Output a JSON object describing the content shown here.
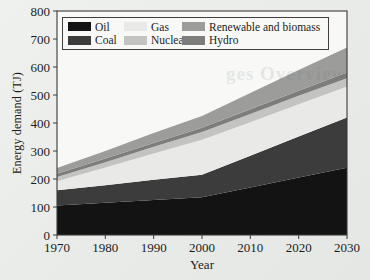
{
  "figure": {
    "background_color": "#e9ebe8",
    "plot_background": "#f8f9f6",
    "frame_color": "#3a3a3a",
    "text_color": "#1c1c1c",
    "ghost_text": "ges Overview"
  },
  "chart_data": {
    "type": "area",
    "stacked": true,
    "title": "",
    "xlabel": "Year",
    "ylabel": "Energy demand (TJ)",
    "x": [
      1970,
      1980,
      1990,
      2000,
      2010,
      2020,
      2030
    ],
    "xlim": [
      1970,
      2030
    ],
    "ylim": [
      0,
      800
    ],
    "x_ticks": [
      1970,
      1980,
      1990,
      2000,
      2010,
      2020,
      2030
    ],
    "y_ticks": [
      0,
      100,
      200,
      300,
      400,
      500,
      600,
      700,
      800
    ],
    "grid": false,
    "stack_order_bottom_to_top": [
      "Oil",
      "Coal",
      "Gas",
      "Nuclear",
      "Hydro",
      "Renewable and biomass"
    ],
    "legend": {
      "position": "upper-left",
      "columns": 3,
      "order": [
        "Oil",
        "Coal",
        "Gas",
        "Nuclear",
        "Renewable and biomass",
        "Hydro"
      ]
    },
    "series": [
      {
        "name": "Oil",
        "color": "#131313",
        "values": [
          105,
          115,
          125,
          135,
          170,
          205,
          240
        ]
      },
      {
        "name": "Coal",
        "color": "#3c3c3c",
        "values": [
          55,
          63,
          72,
          80,
          113,
          147,
          180
        ]
      },
      {
        "name": "Gas",
        "color": "#e9e9e7",
        "values": [
          32,
          63,
          94,
          125,
          120,
          115,
          110
        ]
      },
      {
        "name": "Nuclear",
        "color": "#c3c3c1",
        "values": [
          15,
          19,
          24,
          28,
          29,
          30,
          30
        ]
      },
      {
        "name": "Hydro",
        "color": "#7d7d7b",
        "values": [
          12,
          13,
          14,
          15,
          17,
          18,
          20
        ]
      },
      {
        "name": "Renewable and biomass",
        "color": "#9c9c9a",
        "values": [
          20,
          27,
          35,
          42,
          58,
          74,
          90
        ]
      }
    ],
    "totals_by_year": [
      239,
      300,
      364,
      425,
      507,
      589,
      670
    ]
  }
}
